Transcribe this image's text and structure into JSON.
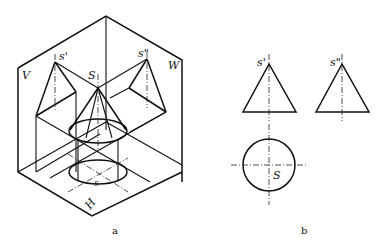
{
  "figure_a": {
    "caption": "a",
    "planes": {
      "v": "V",
      "w": "W",
      "h": "H"
    },
    "points": {
      "apex_v": "s'",
      "apex_w": "s\"",
      "apex": "S",
      "apex_h": "s"
    }
  },
  "figure_b": {
    "caption": "b",
    "labels": {
      "front_apex": "s'",
      "side_apex": "s\"",
      "top_center": "S"
    }
  }
}
